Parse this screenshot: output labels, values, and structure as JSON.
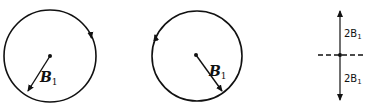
{
  "figure": {
    "panels": [
      {
        "id": "circle-left",
        "rotation": "clockwise",
        "vector_label": "B",
        "vector_subscript": "1"
      },
      {
        "id": "circle-right",
        "rotation": "counterclockwise",
        "vector_label": "B",
        "vector_subscript": "1"
      },
      {
        "id": "linear",
        "upper_label": "2B",
        "upper_subscript": "1",
        "lower_label": "2B",
        "lower_subscript": "1"
      }
    ],
    "stroke_color": "#111111",
    "background": "#ffffff"
  }
}
